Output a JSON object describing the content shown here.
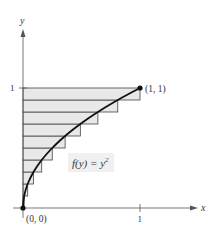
{
  "figure": {
    "type": "riemann-sum-diagram",
    "function_label": "f(y) = y",
    "function_exponent": "2",
    "x_axis_label": "x",
    "y_axis_label": "y",
    "x_tick_label": "1",
    "y_tick_label": "1",
    "origin_label": "(0, 0)",
    "endpoint_label": "(1, 1)",
    "rectangles": {
      "count": 10,
      "orientation": "horizontal",
      "height": 0.1,
      "widths": [
        0.01,
        0.04,
        0.09,
        0.16,
        0.25,
        0.36,
        0.49,
        0.64,
        0.81,
        1.0
      ],
      "fill": "#e8e8e8",
      "stroke": "#444444"
    },
    "curve_color": "#111111",
    "axis_color": "#555555",
    "label_bg": "#f0f0f0"
  }
}
